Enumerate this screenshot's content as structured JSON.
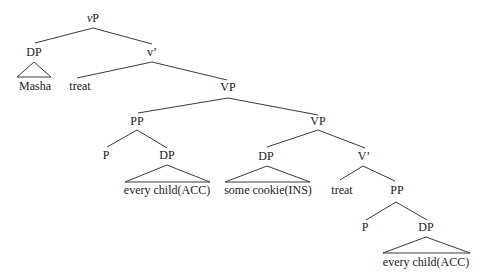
{
  "tree": {
    "nodes": {
      "vP_prefix": "v",
      "vP_suffix": "P",
      "DP_subject": "DP",
      "Masha": "Masha",
      "v_bar": "v’",
      "treat_v": "treat",
      "VP_top": "VP",
      "PP_high": "PP",
      "P_high": "P",
      "DP_high": "DP",
      "every_child_high": "every child(ACC)",
      "VP_low": "VP",
      "DP_ins": "DP",
      "some_cookie": "some cookie(INS)",
      "V_bar": "V’",
      "treat_V": "treat",
      "PP_low": "PP",
      "P_low": "P",
      "DP_low": "DP",
      "every_child_low": "every child(ACC)"
    }
  }
}
